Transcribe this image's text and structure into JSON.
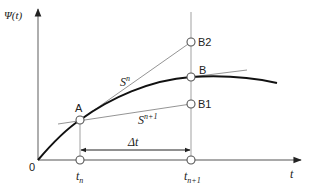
{
  "figure": {
    "type": "time-integration-schematic",
    "y_axis_label": "Ψ(t)",
    "x_axis_label": "t",
    "origin_label": "0",
    "points": {
      "A": "A",
      "B": "B",
      "B1": "B1",
      "B2": "B2"
    },
    "time_ticks": {
      "t_n_base": "t",
      "t_n_sub": "n",
      "t_n1_base": "t",
      "t_n1_sub": "n+1"
    },
    "slopes": {
      "s_n_base": "S",
      "s_n_sup": "n",
      "s_n1_base": "S",
      "s_n1_sup": "n+1"
    },
    "interval_label": "Δt",
    "colors": {
      "axis": "#8c8c8c",
      "guide": "#aaaaaa",
      "curve": "#111111",
      "tangent": "#888888",
      "marker_fill": "#ffffff",
      "marker_stroke": "#555555",
      "text": "#222222"
    }
  }
}
